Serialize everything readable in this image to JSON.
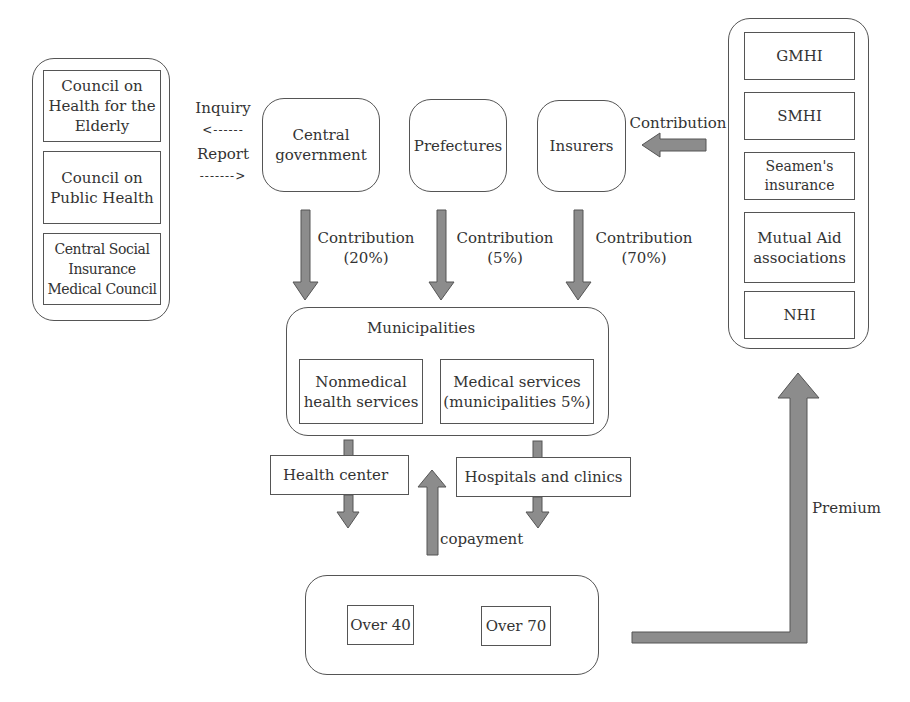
{
  "councils": {
    "items": [
      {
        "label": "Council on Health for the Elderly"
      },
      {
        "label": "Council on Public Health"
      },
      {
        "label": "Central Social Insurance Medical Council"
      }
    ]
  },
  "exchange": {
    "inquiry": "Inquiry",
    "inquiry_arrow": "<------",
    "report": "Report",
    "report_arrow": "------->"
  },
  "payers": {
    "central_government": "Central government",
    "prefectures": "Prefectures",
    "insurers": "Insurers"
  },
  "insurer_contribution_label": "Contribution",
  "contributions": [
    {
      "label": "Contribution",
      "pct": "(20%)"
    },
    {
      "label": "Contribution",
      "pct": "(5%)"
    },
    {
      "label": "Contribution",
      "pct": "(70%)"
    }
  ],
  "insurance_schemes": {
    "items": [
      {
        "label": "GMHI"
      },
      {
        "label": "SMHI"
      },
      {
        "label": "Seamen's insurance"
      },
      {
        "label": "Mutual Aid associations"
      },
      {
        "label": "NHI"
      }
    ]
  },
  "municipalities": {
    "title": "Municipalities",
    "nonmedical": "Nonmedical health services",
    "medical": "Medical services (municipalities 5%)"
  },
  "providers": {
    "health_center": "Health center",
    "hospitals": "Hospitals and clinics"
  },
  "copayment_label": "copayment",
  "premium_label": "Premium",
  "beneficiaries": {
    "over40": "Over 40",
    "over70": "Over 70"
  },
  "colors": {
    "arrow_fill": "#8c8c8c",
    "border": "#555555"
  }
}
